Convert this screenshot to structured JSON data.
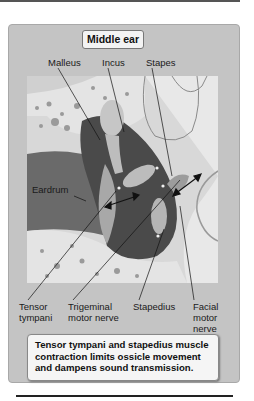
{
  "figure": {
    "title": "Middle ear",
    "labels_top": {
      "malleus": "Malleus",
      "incus": "Incus",
      "stapes": "Stapes"
    },
    "labels_side": {
      "eardrum": "Eardrum"
    },
    "labels_bottom": {
      "tensor_tympani_line1": "Tensor",
      "tensor_tympani_line2": "tympani",
      "trigeminal_line1": "Trigeminal",
      "trigeminal_line2": "motor nerve",
      "stapedius": "Stapedius",
      "facial_line1": "Facial",
      "facial_line2": "motor",
      "facial_line3": "nerve"
    },
    "caption": {
      "line1": "Tensor tympani and stapedius muscle",
      "line2": "contraction limits ossicle movement",
      "line3": "and dampens sound transmission."
    },
    "colors": {
      "panel_bg": "#c4c4c4",
      "box_bg": "#f3f3f3",
      "bone": "#e6e6e6",
      "cavity_dark": "#4a4a4a",
      "canal": "#6a6a6a",
      "ossicle": "#bdbdbd"
    }
  }
}
